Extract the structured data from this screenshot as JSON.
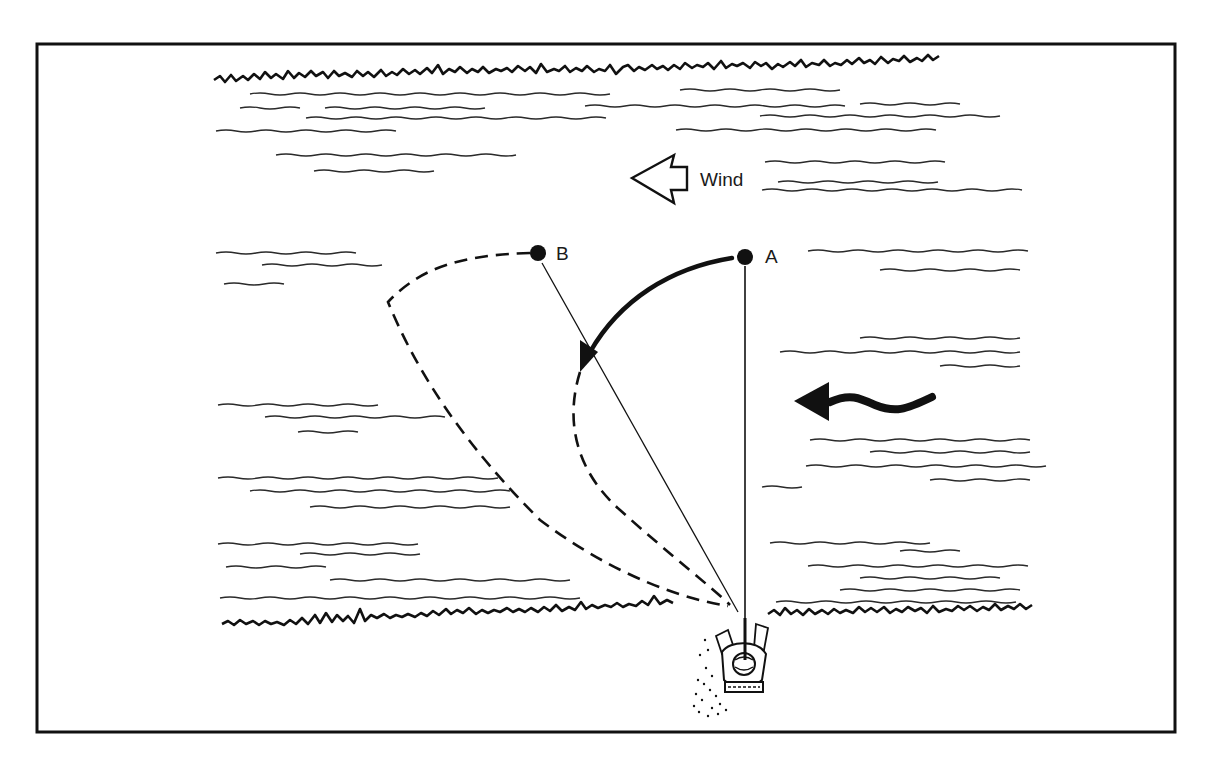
{
  "figure": {
    "type": "illustration",
    "colors": {
      "ink": "#111111",
      "background": "#ffffff"
    }
  },
  "labels": {
    "wind": "Wind",
    "point_a": "A",
    "point_b": "B"
  },
  "elements": {
    "wind_arrow": {
      "icon": "hollow-left-arrow",
      "direction": "left"
    },
    "current_arrow": {
      "icon": "wavy-solid-left-arrow",
      "direction": "left"
    },
    "drift_arrow": {
      "icon": "curved-arrow",
      "from": "A",
      "to": "mid-drift"
    },
    "line_a": {
      "style": "solid",
      "from": "angler",
      "to": "A"
    },
    "line_b": {
      "style": "solid",
      "from": "angler",
      "to": "B"
    },
    "belly_line": {
      "style": "dashed",
      "from": "angler",
      "to": "B"
    },
    "angler": {
      "icon": "angler-top-view"
    }
  }
}
